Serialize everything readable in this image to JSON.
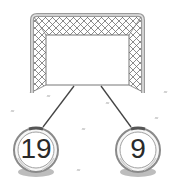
{
  "diagram": {
    "type": "number-bond",
    "goal": {
      "label": "",
      "value": null
    },
    "parts": [
      {
        "value": "19"
      },
      {
        "value": "9"
      }
    ]
  },
  "colors": {
    "frame": "#9a9a9a",
    "frame_light": "#d8d8d8",
    "net": "#6e6e6e",
    "line": "#444444",
    "ball_rim": "#8a8a8a",
    "ball_band": "#555555",
    "shadow": "#bdbdbd",
    "text": "#2a2a2a",
    "grass": "#b5b5b5"
  }
}
